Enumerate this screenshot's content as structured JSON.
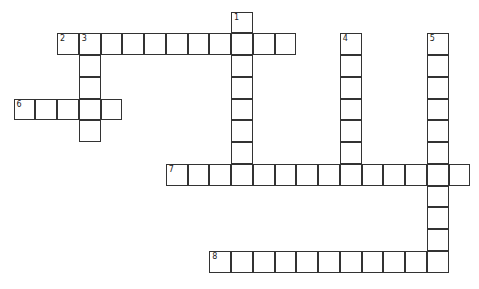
{
  "puzzle": {
    "type": "crossword",
    "origin_x": 14,
    "origin_y": 12,
    "cell_size": 21.75,
    "entries": [
      {
        "number": "1",
        "direction": "down",
        "row": 0,
        "col": 10,
        "length": 8
      },
      {
        "number": "2",
        "direction": "across",
        "row": 1,
        "col": 2,
        "length": 11
      },
      {
        "number": "3",
        "direction": "down",
        "row": 1,
        "col": 3,
        "length": 5
      },
      {
        "number": "4",
        "direction": "down",
        "row": 1,
        "col": 15,
        "length": 7
      },
      {
        "number": "5",
        "direction": "down",
        "row": 1,
        "col": 19,
        "length": 11
      },
      {
        "number": "6",
        "direction": "across",
        "row": 4,
        "col": 0,
        "length": 5
      },
      {
        "number": "7",
        "direction": "across",
        "row": 7,
        "col": 7,
        "length": 14
      },
      {
        "number": "8",
        "direction": "across",
        "row": 11,
        "col": 9,
        "length": 11
      }
    ]
  }
}
